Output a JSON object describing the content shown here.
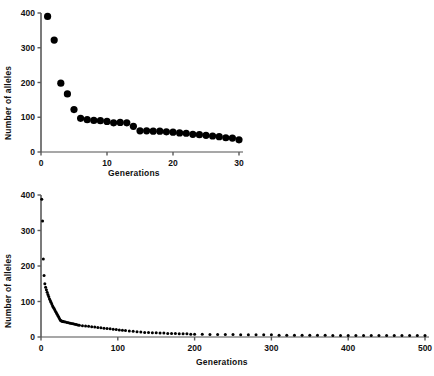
{
  "figure": {
    "title": "",
    "panels": [
      "top",
      "bottom"
    ]
  },
  "labels": {
    "y_axis": "Number of alleles",
    "x_axis": "Generations"
  },
  "chart_data": [
    {
      "type": "scatter",
      "panel": "top",
      "title": "",
      "xlabel": "Generations",
      "ylabel": "Number of alleles",
      "xlim": [
        0,
        30
      ],
      "ylim": [
        0,
        400
      ],
      "xticks": [
        0,
        10,
        20,
        30
      ],
      "yticks": [
        0,
        100,
        200,
        300,
        400
      ],
      "xtick_labels": [
        "0",
        "10",
        "20",
        "30"
      ],
      "ytick_labels": [
        "0",
        "100",
        "200",
        "300",
        "400"
      ],
      "grid": false,
      "legend": false,
      "marker": "filled-circle",
      "marker_color": "#000000",
      "marker_size": 3.6,
      "series": [
        {
          "name": "alleles",
          "x": [
            1,
            2,
            3,
            4,
            5,
            6,
            7,
            8,
            9,
            10,
            11,
            12,
            13,
            14,
            15,
            16,
            17,
            18,
            19,
            20,
            21,
            22,
            23,
            24,
            25,
            26,
            27,
            28,
            29,
            30
          ],
          "values": [
            390,
            322,
            198,
            167,
            122,
            97,
            93,
            91,
            90,
            88,
            84,
            85,
            84,
            74,
            61,
            61,
            60,
            60,
            58,
            57,
            55,
            54,
            51,
            50,
            48,
            46,
            44,
            41,
            40,
            35
          ]
        }
      ]
    },
    {
      "type": "scatter",
      "panel": "bottom",
      "title": "",
      "xlabel": "Generations",
      "ylabel": "Number of alleles",
      "xlim": [
        0,
        500
      ],
      "ylim": [
        0,
        400
      ],
      "xticks": [
        0,
        100,
        200,
        300,
        400,
        500
      ],
      "yticks": [
        0,
        100,
        200,
        300,
        400
      ],
      "xtick_labels": [
        "0",
        "100",
        "200",
        "300",
        "400",
        "500"
      ],
      "ytick_labels": [
        "0",
        "100",
        "200",
        "300",
        "400"
      ],
      "grid": false,
      "legend": false,
      "marker": "filled-circle",
      "marker_color": "#000000",
      "marker_size": 1.5,
      "series": [
        {
          "name": "alleles",
          "x": [
            1,
            2,
            3,
            4,
            5,
            6,
            7,
            8,
            9,
            10,
            11,
            12,
            13,
            14,
            15,
            16,
            17,
            18,
            19,
            20,
            21,
            22,
            23,
            24,
            25,
            26,
            27,
            28,
            29,
            30,
            32,
            34,
            36,
            38,
            40,
            42,
            44,
            46,
            48,
            50,
            54,
            58,
            62,
            66,
            70,
            74,
            78,
            82,
            86,
            90,
            94,
            98,
            102,
            106,
            110,
            115,
            120,
            125,
            130,
            135,
            140,
            145,
            150,
            155,
            160,
            165,
            170,
            175,
            180,
            185,
            190,
            195,
            200,
            210,
            220,
            230,
            240,
            250,
            260,
            270,
            280,
            290,
            300,
            310,
            320,
            330,
            340,
            350,
            360,
            370,
            380,
            390,
            400,
            410,
            420,
            430,
            440,
            450,
            460,
            470,
            480,
            490,
            500
          ],
          "values": [
            388,
            327,
            220,
            173,
            150,
            140,
            133,
            126,
            120,
            114,
            108,
            103,
            98,
            93,
            88,
            84,
            80,
            76,
            72,
            68,
            64,
            60,
            56,
            52,
            48,
            46,
            45,
            44,
            44,
            43,
            42,
            41,
            40,
            39,
            38,
            37,
            36,
            35,
            34,
            33,
            32,
            31,
            30,
            29,
            28,
            27,
            26,
            25,
            24,
            23,
            22,
            21,
            20,
            19,
            18,
            17,
            16,
            15,
            14,
            13,
            13,
            12,
            12,
            11,
            11,
            10,
            10,
            10,
            9,
            9,
            9,
            8,
            8,
            8,
            7,
            7,
            7,
            7,
            6,
            6,
            6,
            6,
            6,
            5,
            5,
            5,
            5,
            5,
            5,
            5,
            4,
            4,
            4,
            4,
            4,
            4,
            4,
            4,
            4,
            4,
            4,
            4,
            4
          ]
        }
      ]
    }
  ]
}
